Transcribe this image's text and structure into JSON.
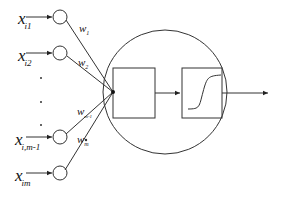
{
  "diagram": {
    "title": "",
    "type": "artificial neuron model",
    "inputs": [
      {
        "symbol": "x",
        "subscript": "i1",
        "cy": 17
      },
      {
        "symbol": "x",
        "subscript": "i2",
        "cy": 53
      },
      {
        "symbol": "x",
        "subscript": "i,m-1",
        "cy": 137
      },
      {
        "symbol": "x",
        "subscript": "im",
        "cy": 173
      }
    ],
    "weights": [
      {
        "symbol": "w",
        "subscript": "1"
      },
      {
        "symbol": "w",
        "subscript": "2"
      },
      {
        "symbol": "w",
        "subscript": "m-1"
      },
      {
        "symbol": "w",
        "subscript": "m"
      }
    ],
    "ellipsis": "...",
    "blocks": [
      {
        "name": "summation",
        "label": ""
      },
      {
        "name": "activation",
        "label": "",
        "function": "sigmoid"
      }
    ],
    "output_label": "",
    "colors": {
      "stroke": "#333333",
      "background": "#ffffff"
    }
  }
}
